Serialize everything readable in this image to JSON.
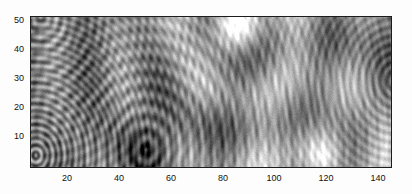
{
  "figure": {
    "title": "",
    "background_color": "#fdfdfd",
    "axes_color": "#1c1c1c",
    "plot_rect": {
      "left": 30,
      "top": 16,
      "width": 362,
      "height": 152
    }
  },
  "chart_data": {
    "type": "heatmap",
    "title": "",
    "xlabel": "",
    "ylabel": "",
    "colormap": "gray",
    "grid": false,
    "legend": "none",
    "xlim": [
      0,
      150
    ],
    "ylim": [
      0,
      52
    ],
    "xticks": [
      20,
      40,
      60,
      80,
      100,
      120,
      140
    ],
    "xtick_labels": [
      "20",
      "40",
      "60",
      "80",
      "100",
      "120",
      "140"
    ],
    "yticks": [
      10,
      20,
      30,
      40,
      50
    ],
    "ytick_labels": [
      "10",
      "20",
      "30",
      "40",
      "50"
    ],
    "sources": [
      {
        "name": "source-left-low",
        "x": 2,
        "y": 4,
        "wavelength": 2.4,
        "amplitude": 1.0,
        "phase": 0.0
      },
      {
        "name": "source-mid-dome",
        "x": 48,
        "y": 6,
        "wavelength": 5.0,
        "amplitude": 0.9,
        "phase": 1.1
      },
      {
        "name": "source-top-bright",
        "x": 86,
        "y": 50,
        "wavelength": 26.0,
        "amplitude": 1.3,
        "phase": 0.0
      },
      {
        "name": "source-right-bright",
        "x": 122,
        "y": 3,
        "wavelength": 30.0,
        "amplitude": 1.25,
        "phase": 0.4
      },
      {
        "name": "source-right-edge",
        "x": 152,
        "y": 30,
        "wavelength": 3.0,
        "amplitude": 0.7,
        "phase": 2.0
      },
      {
        "name": "source-upper-left",
        "x": 4,
        "y": 52,
        "wavelength": 3.6,
        "amplitude": 0.8,
        "phase": 0.8
      }
    ],
    "value_range": [
      -1,
      1
    ],
    "n_samples_x": 360,
    "n_samples_y": 150
  }
}
